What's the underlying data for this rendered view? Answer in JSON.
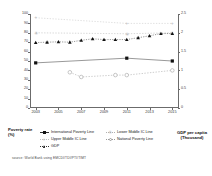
{
  "axes": {
    "left_title": "Poverty rate (%)",
    "right_title": "GDP per capita (Thousand)",
    "left_ticks": [
      "100",
      "90",
      "80",
      "70",
      "60",
      "50",
      "40",
      "30",
      "20",
      "10",
      "0"
    ],
    "right_ticks": [
      "2.5",
      "2",
      "1.5",
      "1",
      "0.5",
      "0"
    ],
    "x_ticks": [
      "2003",
      "2005",
      "2007",
      "2009",
      "2011",
      "2013",
      "2015"
    ]
  },
  "legend": {
    "items": [
      {
        "label": "International Poverty Line",
        "marker": "square",
        "color": "#111111"
      },
      {
        "label": "Lower Middle IC Line",
        "marker": "star",
        "color": "#b0b0b0"
      },
      {
        "label": "Upper Middle IC Line",
        "marker": "plus",
        "color": "#c0c0c0"
      },
      {
        "label": "National Poverty Line",
        "marker": "circle",
        "color": "#9a9a9a"
      },
      {
        "label": "GDP",
        "marker": "triangle",
        "color": "#111111"
      }
    ]
  },
  "source": "source: World Bank using EMCDI/TDI/PTI/TIMT",
  "chart_data": {
    "type": "line",
    "title": "",
    "xlabel": "",
    "ylabel": "Poverty rate (%)",
    "y2label": "GDP per capita (Thousand)",
    "xlim": [
      2002.5,
      2015.5
    ],
    "ylim": [
      0,
      100
    ],
    "y2lim": [
      0,
      2.5
    ],
    "grid": false,
    "legend_position": "bottom",
    "x": [
      2003,
      2004,
      2005,
      2006,
      2007,
      2008,
      2009,
      2010,
      2011,
      2012,
      2013,
      2014,
      2015
    ],
    "series": [
      {
        "name": "International Poverty Line",
        "axis": "left",
        "marker": "filled-square",
        "color": "#111111",
        "points": [
          {
            "x": 2003,
            "y": 48
          },
          {
            "x": 2011,
            "y": 53
          },
          {
            "x": 2015,
            "y": 50
          }
        ]
      },
      {
        "name": "Lower Middle IC Line",
        "axis": "left",
        "marker": "star",
        "color": "#b0b0b0",
        "points": [
          {
            "x": 2003,
            "y": 80
          },
          {
            "x": 2011,
            "y": 79
          },
          {
            "x": 2015,
            "y": 80
          }
        ]
      },
      {
        "name": "Upper Middle IC Line",
        "axis": "left",
        "marker": "plus",
        "color": "#c0c0c0",
        "points": [
          {
            "x": 2003,
            "y": 96
          },
          {
            "x": 2011,
            "y": 90
          },
          {
            "x": 2015,
            "y": 90
          }
        ]
      },
      {
        "name": "National Poverty Line",
        "axis": "left",
        "marker": "open-circle",
        "color": "#9a9a9a",
        "points": [
          {
            "x": 2006,
            "y": 38
          },
          {
            "x": 2007,
            "y": 33
          },
          {
            "x": 2010,
            "y": 35
          },
          {
            "x": 2011,
            "y": 35
          },
          {
            "x": 2015,
            "y": 40
          }
        ]
      },
      {
        "name": "GDP",
        "axis": "right",
        "marker": "filled-triangle",
        "color": "#111111",
        "points": [
          {
            "x": 2003,
            "y": 1.74
          },
          {
            "x": 2004,
            "y": 1.75
          },
          {
            "x": 2005,
            "y": 1.76
          },
          {
            "x": 2006,
            "y": 1.75
          },
          {
            "x": 2007,
            "y": 1.8
          },
          {
            "x": 2008,
            "y": 1.84
          },
          {
            "x": 2009,
            "y": 1.82
          },
          {
            "x": 2010,
            "y": 1.82
          },
          {
            "x": 2011,
            "y": 1.82
          },
          {
            "x": 2012,
            "y": 1.87
          },
          {
            "x": 2013,
            "y": 1.92
          },
          {
            "x": 2014,
            "y": 1.98
          },
          {
            "x": 2015,
            "y": 1.98
          }
        ]
      }
    ]
  }
}
